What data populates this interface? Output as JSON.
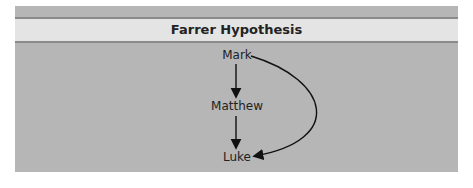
{
  "title": "Farrer Hypothesis",
  "nodes": [
    {
      "id": "mark",
      "label": "Mark"
    },
    {
      "id": "matthew",
      "label": "Matthew"
    },
    {
      "id": "luke",
      "label": "Luke"
    }
  ],
  "edges": [
    {
      "from": "Mark",
      "to": "Matthew"
    },
    {
      "from": "Matthew",
      "to": "Luke"
    },
    {
      "from": "Mark",
      "to": "Luke"
    }
  ],
  "colors": {
    "panel": "#b6b6b6",
    "header": "#e4e4e4",
    "rule": "#8a8a8a",
    "text": "#222222"
  }
}
